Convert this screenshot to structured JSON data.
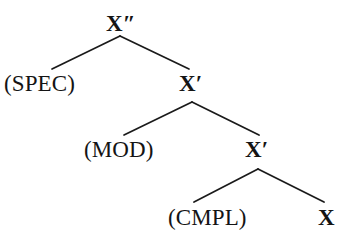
{
  "figure": {
    "kind": "syntax-tree",
    "theory": "X-bar schema",
    "background_color": "#ffffff",
    "stroke_color": "#1a1a1a",
    "text_color": "#141414"
  },
  "nodes": {
    "root": {
      "label": "X″",
      "role": "maximal-projection"
    },
    "spec": {
      "label": "(SPEC)",
      "role": "specifier"
    },
    "xbar1": {
      "label": "X′",
      "role": "intermediate-projection"
    },
    "mod": {
      "label": "(MOD)",
      "role": "modifier"
    },
    "xbar2": {
      "label": "X′",
      "role": "intermediate-projection"
    },
    "cmpl": {
      "label": "(CMPL)",
      "role": "complement"
    },
    "head": {
      "label": "X",
      "role": "head"
    }
  },
  "branches": [
    {
      "name": "root-to-spec",
      "from": "root",
      "to": "spec",
      "x1": 120,
      "y1": 36,
      "x2": 52,
      "y2": 69
    },
    {
      "name": "root-to-xbar1",
      "from": "root",
      "to": "xbar1",
      "x1": 120,
      "y1": 36,
      "x2": 189,
      "y2": 69
    },
    {
      "name": "xbar1-to-mod",
      "from": "xbar1",
      "to": "mod",
      "x1": 192,
      "y1": 102,
      "x2": 124,
      "y2": 135
    },
    {
      "name": "xbar1-to-xbar2",
      "from": "xbar1",
      "to": "xbar2",
      "x1": 192,
      "y1": 102,
      "x2": 259,
      "y2": 135
    },
    {
      "name": "xbar2-to-cmpl",
      "from": "xbar2",
      "to": "cmpl",
      "x1": 258,
      "y1": 169,
      "x2": 194,
      "y2": 202
    },
    {
      "name": "xbar2-to-head",
      "from": "xbar2",
      "to": "head",
      "x1": 258,
      "y1": 169,
      "x2": 324,
      "y2": 202
    }
  ]
}
